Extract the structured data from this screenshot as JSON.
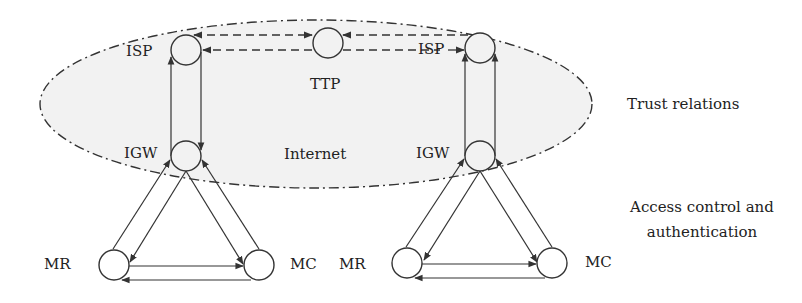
{
  "diagram": {
    "region_label": "Internet",
    "nodes": {
      "left_isp": "ISP",
      "ttp": "TTP",
      "right_isp": "ISP",
      "left_igw": "IGW",
      "right_igw": "IGW",
      "left_mr": "MR",
      "left_mc": "MC",
      "right_mr": "MR",
      "right_mc": "MC"
    },
    "annotations": {
      "trust": "Trust relations",
      "access_line1": "Access control and",
      "access_line2": "authentication"
    },
    "colors": {
      "ellipse_fill": "#f2f2f2",
      "stroke": "#333333"
    }
  }
}
